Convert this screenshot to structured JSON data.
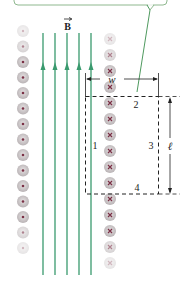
{
  "diagram": {
    "field_label": "B",
    "field_label_has_vector_arrow": true,
    "width_label": "w",
    "length_label": "ℓ",
    "path_segment_labels": [
      "1",
      "2",
      "3",
      "4"
    ],
    "callout_box_text": ""
  },
  "colors": {
    "field_line": "#3a9a6e",
    "callout_border": "#8fb88f",
    "dashed_loop": "#222222",
    "dimension_line": "#222222",
    "circle_fill": "#c8c3c5",
    "circle_mark": "#7a3045",
    "background": "#ffffff"
  },
  "elements": {
    "field_lines_count": 5,
    "field_direction": "up",
    "left_column": {
      "symbol": "dot",
      "meaning": "current out of page",
      "count": 15
    },
    "right_column": {
      "symbol": "cross",
      "meaning": "current into page",
      "count": 15
    }
  }
}
